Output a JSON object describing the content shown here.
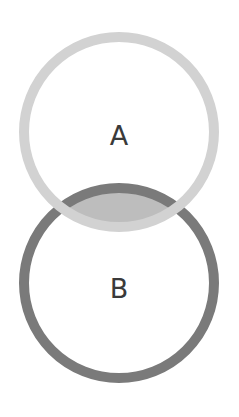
{
  "diagram": {
    "type": "venn",
    "sets": [
      {
        "id": "A",
        "label": "A",
        "stroke_color": "#d2d2d2"
      },
      {
        "id": "B",
        "label": "B",
        "stroke_color": "#7a7a7a"
      }
    ],
    "intersection": {
      "fill_color": "#bdbdbd"
    },
    "background": "#ffffff"
  }
}
